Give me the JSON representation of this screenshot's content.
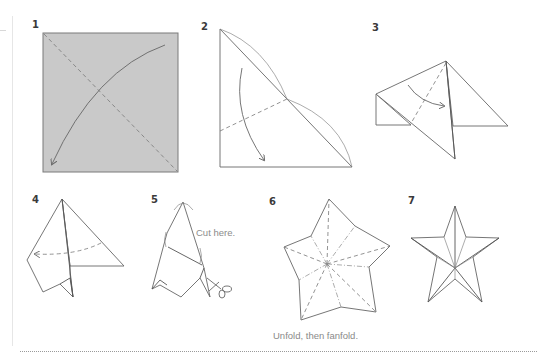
{
  "steps": [
    {
      "number": "1",
      "instruction": "Fold diagonally (fold corner to opposite corner)",
      "icon": "gray-square-paper"
    },
    {
      "number": "2",
      "instruction": "Fold triangle; dashed fold line with curved arrow down",
      "icon": "triangle-fold"
    },
    {
      "number": "3",
      "instruction": "Fold along dashed line in direction of arrow",
      "icon": "kite-fold"
    },
    {
      "number": "4",
      "instruction": "Fold back along dashed line to the left",
      "icon": "point-fold"
    },
    {
      "number": "5",
      "instruction": "Cut along the line",
      "icon": "scissors",
      "label": "Cut here."
    },
    {
      "number": "6",
      "instruction": "Unfold star with crease lines",
      "icon": "unfolded-star",
      "label": "Unfold, then fanfold."
    },
    {
      "number": "7",
      "instruction": "Finished 3D star",
      "icon": "finished-star"
    }
  ],
  "colors": {
    "paper_fill": "#c9c9c9",
    "line": "#555555",
    "number_text": "#3a3a3a",
    "caption_text": "#8a8a8a"
  }
}
